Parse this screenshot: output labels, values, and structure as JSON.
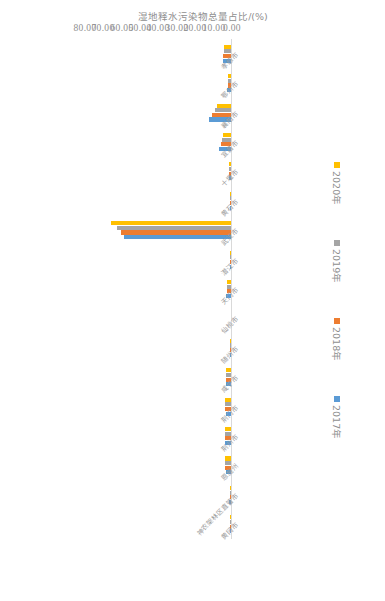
{
  "chart_data": {
    "type": "bar",
    "orientation": "horizontal",
    "title": "",
    "xlabel": "",
    "ylabel": "湿地释水污染物总量占比/(%)",
    "ylim": [
      0,
      80
    ],
    "axis_ticks": [
      "0.00",
      "10.00",
      "20.00",
      "30.00",
      "40.00",
      "50.00",
      "60.00",
      "70.00",
      "80.00"
    ],
    "grid": false,
    "legend_position": "bottom",
    "categories": [
      "黄冈市",
      "神农架林区直管市",
      "恩施州",
      "荆州市",
      "荆门市",
      "咸宁市",
      "随州市",
      "仙桃市",
      "天门市",
      "潜江市",
      "武汉市",
      "黄石市",
      "十堰市",
      "宜昌市",
      "襄阳市",
      "鄂州市",
      "孝感市"
    ],
    "series": [
      {
        "name": "2017年",
        "color": "#5b9bd5",
        "values": [
          0.55,
          1.35,
          2.95,
          3.15,
          2.85,
          2.6,
          0.2,
          0.0,
          2.95,
          0.5,
          58.2,
          0.3,
          1.25,
          6.3,
          12.1,
          1.95,
          4.4
        ]
      },
      {
        "name": "2018年",
        "color": "#ed7d31",
        "values": [
          0.6,
          0.15,
          3.1,
          3.25,
          3.0,
          2.7,
          0.18,
          0.0,
          2.2,
          0.45,
          60.1,
          0.25,
          1.1,
          5.6,
          10.4,
          1.7,
          4.2
        ]
      },
      {
        "name": "2019年",
        "color": "#a5a5a5",
        "values": [
          0.62,
          0.12,
          3.05,
          3.2,
          3.05,
          2.65,
          0.16,
          0.0,
          2.05,
          0.4,
          62.3,
          0.22,
          1.05,
          5.1,
          8.7,
          1.55,
          4.05
        ]
      },
      {
        "name": "2020年",
        "color": "#ffc000",
        "values": [
          0.65,
          0.1,
          3.0,
          3.15,
          3.1,
          2.6,
          0.15,
          0.0,
          1.95,
          0.35,
          65.4,
          0.2,
          1.0,
          4.6,
          7.6,
          1.4,
          3.9
        ]
      }
    ]
  },
  "legend": {
    "items": [
      {
        "label": "2017年",
        "color": "#5b9bd5"
      },
      {
        "label": "2018年",
        "color": "#ed7d31"
      },
      {
        "label": "2019年",
        "color": "#a5a5a5"
      },
      {
        "label": "2020年",
        "color": "#ffc000"
      }
    ]
  }
}
